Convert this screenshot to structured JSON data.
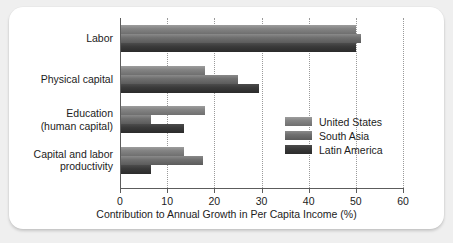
{
  "chart_data": {
    "type": "bar",
    "orientation": "horizontal",
    "title": "",
    "xlabel": "Contribution to Annual Growth in Per Capita Income (%)",
    "ylabel": "",
    "xlim": [
      0,
      60
    ],
    "xticks": [
      0,
      10,
      20,
      30,
      40,
      50,
      60
    ],
    "xtick_labels": [
      "0",
      "10",
      "20",
      "30",
      "40",
      "50",
      "60"
    ],
    "grid": "vertical-dotted",
    "legend_position": "inside-right",
    "categories": [
      "Labor",
      "Physical capital",
      "Education\n(human capital)",
      "Capital and labor\nproductivity"
    ],
    "category_lines": [
      [
        "Labor"
      ],
      [
        "Physical capital"
      ],
      [
        "Education",
        "(human capital)"
      ],
      [
        "Capital and labor",
        "productivity"
      ]
    ],
    "series": [
      {
        "name": "United States",
        "key": "us",
        "color": "#848484",
        "values": [
          50.0,
          18.0,
          18.0,
          13.5
        ]
      },
      {
        "name": "South Asia",
        "key": "sa",
        "color": "#707070",
        "values": [
          51.0,
          25.0,
          6.5,
          17.5
        ]
      },
      {
        "name": "Latin America",
        "key": "la",
        "color": "#3a3a3a",
        "values": [
          50.0,
          29.5,
          13.5,
          6.5
        ]
      }
    ]
  },
  "legend": {
    "entries": [
      {
        "label": "United States",
        "key": "us"
      },
      {
        "label": "South Asia",
        "key": "sa"
      },
      {
        "label": "Latin America",
        "key": "la"
      }
    ]
  },
  "axis": {
    "x_title": "Contribution to Annual Growth in Per Capita Income (%)",
    "tick_labels": [
      "0",
      "10",
      "20",
      "30",
      "40",
      "50",
      "60"
    ]
  },
  "colors": {
    "page_background": "#efefef",
    "card_background": "#ffffff",
    "axis": "#5c5c5c",
    "gridline": "#9a9a9a",
    "text": "#1c1c1c",
    "series_us": "#848484",
    "series_sa": "#707070",
    "series_la": "#3a3a3a"
  }
}
